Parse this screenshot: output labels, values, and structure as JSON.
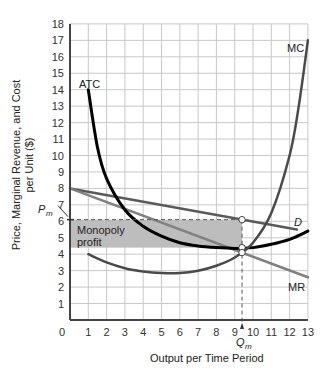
{
  "chart_data": {
    "type": "line",
    "title": "",
    "xlabel": "Output per Time Period",
    "ylabel_line1": "Price, Marginal Revenue, and Cost",
    "ylabel_line2": "per Unit ($)",
    "xlim": [
      0,
      13
    ],
    "ylim": [
      0,
      18
    ],
    "grid": true,
    "x_ticks": [
      0,
      1,
      2,
      3,
      4,
      5,
      6,
      7,
      8,
      9,
      10,
      11,
      12,
      13
    ],
    "y_ticks": [
      1,
      2,
      3,
      4,
      5,
      6,
      7,
      8,
      9,
      10,
      11,
      12,
      13,
      14,
      15,
      16,
      17,
      18
    ],
    "series": [
      {
        "name": "D",
        "label": "D",
        "color": "#5a5a5a",
        "points": [
          [
            0,
            8
          ],
          [
            12.4,
            5.5
          ]
        ]
      },
      {
        "name": "MR",
        "label": "MR",
        "color": "#808080",
        "points": [
          [
            0,
            8
          ],
          [
            13,
            2.6
          ]
        ]
      },
      {
        "name": "ATC",
        "label": "ATC",
        "color": "#000000",
        "points": [
          [
            1,
            14
          ],
          [
            1.5,
            10.5
          ],
          [
            2,
            8.6
          ],
          [
            3,
            6.7
          ],
          [
            4,
            5.7
          ],
          [
            5,
            5.1
          ],
          [
            6,
            4.7
          ],
          [
            7,
            4.5
          ],
          [
            8,
            4.4
          ],
          [
            9,
            4.35
          ],
          [
            10,
            4.4
          ],
          [
            11,
            4.6
          ],
          [
            12,
            4.9
          ],
          [
            13,
            5.4
          ]
        ]
      },
      {
        "name": "MC",
        "label": "MC",
        "color": "#4a4a4a",
        "points": [
          [
            1,
            4
          ],
          [
            2,
            3.5
          ],
          [
            3,
            3.15
          ],
          [
            4,
            2.95
          ],
          [
            5,
            2.85
          ],
          [
            6,
            2.85
          ],
          [
            7,
            3.0
          ],
          [
            8,
            3.3
          ],
          [
            9,
            3.8
          ],
          [
            10,
            4.7
          ],
          [
            11,
            6.5
          ],
          [
            12,
            10
          ],
          [
            12.5,
            13
          ],
          [
            13,
            17
          ]
        ]
      }
    ],
    "annotations": {
      "shaded_region": {
        "label_line1": "Monopoly",
        "label_line2": "profit",
        "x_range": [
          0,
          9.4
        ],
        "y_range": [
          4.4,
          6.1
        ],
        "color": "#bdbdbd"
      },
      "Pm": {
        "label": "P",
        "sub": "m",
        "value": 6.1
      },
      "Qm": {
        "label": "Q",
        "sub": "m",
        "value": 9.4
      },
      "points": [
        [
          9.4,
          6.1
        ],
        [
          9.4,
          4.4
        ],
        [
          9.4,
          4.1
        ]
      ]
    }
  }
}
